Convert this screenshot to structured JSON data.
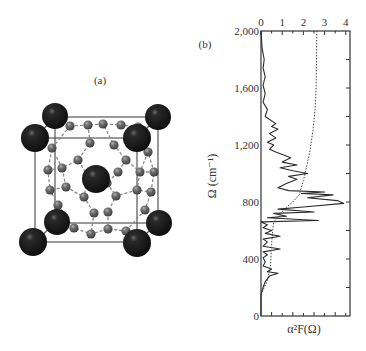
{
  "panels": {
    "a": {
      "label": "(a)"
    },
    "b": {
      "label": "(b)"
    }
  },
  "chart_data": {
    "type": "line",
    "title": "",
    "xlabel": "α²F(Ω)",
    "ylabel": "Ω (cm⁻¹)",
    "x_ticks": [
      "0",
      "1",
      "2",
      "3",
      "4"
    ],
    "y_ticks": [
      "0",
      "400",
      "800",
      "1,200",
      "1,600",
      "2,000"
    ],
    "xlim": [
      0,
      4.2
    ],
    "ylim": [
      0,
      2000
    ],
    "x_axis_position": "top",
    "grid": false,
    "orientation": "Ω on vertical axis, spectral function on horizontal axis",
    "series": [
      {
        "name": "α²F(Ω)",
        "style": "solid",
        "points": [
          [
            0.0,
            0
          ],
          [
            0.0,
            150
          ],
          [
            0.1,
            200
          ],
          [
            0.2,
            240
          ],
          [
            0.4,
            280
          ],
          [
            0.8,
            300
          ],
          [
            0.3,
            310
          ],
          [
            0.5,
            330
          ],
          [
            0.1,
            350
          ],
          [
            0.2,
            380
          ],
          [
            0.1,
            410
          ],
          [
            0.3,
            430
          ],
          [
            0.1,
            450
          ],
          [
            0.9,
            470
          ],
          [
            0.1,
            490
          ],
          [
            0.3,
            520
          ],
          [
            0.1,
            540
          ],
          [
            0.9,
            560
          ],
          [
            0.2,
            580
          ],
          [
            0.5,
            600
          ],
          [
            0.1,
            620
          ],
          [
            0.3,
            640
          ],
          [
            0.0,
            660
          ],
          [
            2.7,
            670
          ],
          [
            0.3,
            690
          ],
          [
            1.2,
            700
          ],
          [
            0.6,
            720
          ],
          [
            2.5,
            730
          ],
          [
            0.8,
            750
          ],
          [
            2.0,
            765
          ],
          [
            3.9,
            790
          ],
          [
            3.6,
            810
          ],
          [
            2.2,
            830
          ],
          [
            3.4,
            850
          ],
          [
            1.9,
            860
          ],
          [
            3.0,
            870
          ],
          [
            1.3,
            880
          ],
          [
            0.8,
            900
          ],
          [
            1.2,
            930
          ],
          [
            1.7,
            960
          ],
          [
            1.3,
            980
          ],
          [
            2.2,
            1000
          ],
          [
            1.5,
            1020
          ],
          [
            0.9,
            1040
          ],
          [
            1.7,
            1060
          ],
          [
            1.0,
            1080
          ],
          [
            1.4,
            1110
          ],
          [
            0.7,
            1150
          ],
          [
            0.4,
            1170
          ],
          [
            0.6,
            1200
          ],
          [
            0.3,
            1220
          ],
          [
            0.7,
            1250
          ],
          [
            0.4,
            1280
          ],
          [
            0.8,
            1310
          ],
          [
            0.5,
            1330
          ],
          [
            0.7,
            1350
          ],
          [
            0.2,
            1400
          ],
          [
            0.3,
            1450
          ],
          [
            0.1,
            1500
          ],
          [
            0.2,
            1560
          ],
          [
            0.1,
            1620
          ],
          [
            0.2,
            1680
          ],
          [
            0.1,
            1740
          ],
          [
            0.15,
            1800
          ],
          [
            0.05,
            1880
          ],
          [
            0.0,
            2000
          ]
        ]
      },
      {
        "name": "λ(Ω) integrated",
        "style": "dotted",
        "points": [
          [
            0.0,
            150
          ],
          [
            0.3,
            250
          ],
          [
            0.45,
            350
          ],
          [
            0.5,
            500
          ],
          [
            0.55,
            600
          ],
          [
            0.6,
            660
          ],
          [
            0.85,
            700
          ],
          [
            1.1,
            750
          ],
          [
            1.5,
            800
          ],
          [
            1.8,
            850
          ],
          [
            2.0,
            950
          ],
          [
            2.15,
            1050
          ],
          [
            2.3,
            1150
          ],
          [
            2.45,
            1300
          ],
          [
            2.55,
            1450
          ],
          [
            2.6,
            1600
          ],
          [
            2.62,
            1800
          ],
          [
            2.63,
            2000
          ]
        ]
      }
    ]
  },
  "structure": {
    "description": "cubic unit cell with large dark corner/center atoms and small grey cage atoms joined by dashed bonds",
    "large_atom_color": "#1a1a1a",
    "small_atom_color": "#6e6e6e"
  }
}
